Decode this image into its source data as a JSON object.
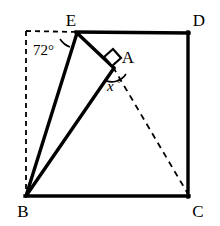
{
  "figure": {
    "background_color": "#ffffff",
    "stroke_color": "#000000",
    "solid_stroke_width": 3,
    "dashed_stroke_width": 1.6,
    "vertices": [
      {
        "name": "E",
        "label": "E",
        "x": 78,
        "y": 32,
        "label_x": 74,
        "label_y": 24
      },
      {
        "name": "D",
        "label": "D",
        "x": 188,
        "y": 33,
        "label_x": 196,
        "label_y": 23
      },
      {
        "name": "A",
        "label": "A",
        "x": 113,
        "y": 67,
        "label_x": 122,
        "label_y": 62
      },
      {
        "name": "B",
        "label": "B",
        "x": 26,
        "y": 196,
        "label_x": 19,
        "label_y": 215
      },
      {
        "name": "C",
        "label": "C",
        "x": 188,
        "y": 196,
        "label_x": 194,
        "label_y": 215
      }
    ],
    "hidden_corner": {
      "name": "top-left-corner",
      "x": 26,
      "y": 31
    },
    "solid_edges": [
      {
        "name": "edge-E-D",
        "from": "E",
        "to": "D"
      },
      {
        "name": "edge-D-C",
        "from": "D",
        "to": "C"
      },
      {
        "name": "edge-C-B",
        "from": "C",
        "to": "B"
      },
      {
        "name": "edge-E-A",
        "from": "E",
        "to": "A"
      },
      {
        "name": "edge-A-B",
        "from": "A",
        "to": "B"
      },
      {
        "name": "edge-E-B",
        "from": "E",
        "to": "B"
      }
    ],
    "dashed_edges": [
      {
        "name": "edge-corner-E",
        "from": "top-left-corner",
        "to": "E"
      },
      {
        "name": "edge-corner-B",
        "from": "top-left-corner",
        "to": "B"
      },
      {
        "name": "edge-A-C",
        "from": "A",
        "to": "C"
      }
    ],
    "angles": [
      {
        "name": "angle-at-E",
        "vertex": "E",
        "label": "72°",
        "value": 72,
        "unit": "degrees",
        "label_x": 33,
        "label_y": 53
      },
      {
        "name": "angle-at-A-unknown",
        "vertex": "A",
        "label": "x",
        "degree_symbol": "°",
        "value": null,
        "unit": "degrees",
        "label_x": 106,
        "label_y": 90
      },
      {
        "name": "right-angle-at-A",
        "vertex": "A",
        "label": "",
        "value": 90,
        "unit": "degrees"
      }
    ]
  }
}
